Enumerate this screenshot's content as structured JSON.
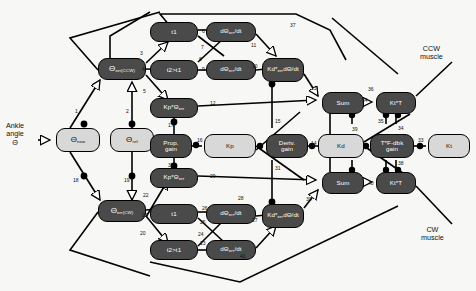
{
  "diagram": {
    "canvas": {
      "width": 476,
      "height": 291
    },
    "colors": {
      "dark_node": "#4a4a4a",
      "light_node": "#d8d8d8",
      "edge": "#000000",
      "background": "#f7f7f5",
      "text_light": "#ffffff",
      "text_dark": "#111111"
    },
    "free_labels": [
      {
        "name": "ankle-angle-label",
        "text": "Ankle\nangle\nΘ",
        "x": 6,
        "y": 122
      },
      {
        "name": "ccw-muscle-label",
        "text": "CCW\nmuscle",
        "x": 420,
        "y": 45
      },
      {
        "name": "cw-muscle-label",
        "text": "CW\nmuscle",
        "x": 421,
        "y": 226
      }
    ],
    "nodes": [
      {
        "id": "theta_now",
        "name": "node-theta-now",
        "label": "Θ",
        "sub": "now",
        "style": "light",
        "x": 56,
        "y": 128,
        "w": 44,
        "h": 24
      },
      {
        "id": "theta_ref",
        "name": "node-theta-ref",
        "label": "Θ",
        "sub": "ref",
        "style": "light",
        "x": 110,
        "y": 128,
        "w": 44,
        "h": 24
      },
      {
        "id": "theta_err_ccw",
        "name": "node-theta-err-ccw",
        "label": "Θ",
        "sub": "err(CCW)",
        "style": "dark",
        "x": 98,
        "y": 58,
        "w": 48,
        "h": 22
      },
      {
        "id": "theta_err_cw",
        "name": "node-theta-err-cw",
        "label": "Θ",
        "sub": "err(CW)",
        "style": "dark",
        "x": 98,
        "y": 200,
        "w": 48,
        "h": 22
      },
      {
        "id": "t1_top",
        "name": "node-t1-top",
        "label": "t1",
        "sub": "",
        "style": "dark",
        "x": 150,
        "y": 22,
        "w": 48,
        "h": 20
      },
      {
        "id": "t2t1_top",
        "name": "node-t2-gt-t1-top",
        "label": "t2>t1",
        "sub": "",
        "style": "dark",
        "x": 150,
        "y": 60,
        "w": 48,
        "h": 20
      },
      {
        "id": "dtheta1_top",
        "name": "node-dtheta-err-dt-top-1",
        "label": "dΘ",
        "sub": "err",
        "label2": "/dt",
        "style": "dark",
        "x": 206,
        "y": 22,
        "w": 50,
        "h": 20
      },
      {
        "id": "dtheta2_top",
        "name": "node-dtheta-err-dt-top-2",
        "label": "dΘ",
        "sub": "err",
        "label2": "/dt",
        "style": "dark",
        "x": 206,
        "y": 60,
        "w": 50,
        "h": 20
      },
      {
        "id": "kp_theta_top",
        "name": "node-kp-theta-err-top",
        "label": "Kp*Θ",
        "sub": "err",
        "style": "dark",
        "x": 150,
        "y": 98,
        "w": 48,
        "h": 20
      },
      {
        "id": "kd_dtheta_top",
        "name": "node-kd-dtheta-err-dt-top",
        "label": "Kd*",
        "label2": "dΘ",
        "sub": "err",
        "label3": "/dt",
        "style": "dark",
        "x": 262,
        "y": 58,
        "w": 42,
        "h": 24
      },
      {
        "id": "prop_gain",
        "name": "node-prop-gain",
        "label": "Prop.",
        "label2": "gain",
        "style": "dark",
        "x": 150,
        "y": 134,
        "w": 42,
        "h": 24
      },
      {
        "id": "kp",
        "name": "node-kp",
        "label": "Kp",
        "style": "light",
        "x": 204,
        "y": 134,
        "w": 52,
        "h": 24
      },
      {
        "id": "deriv_gain",
        "name": "node-deriv-gain",
        "label": "Deriv.",
        "label2": "gain",
        "style": "dark",
        "x": 266,
        "y": 134,
        "w": 42,
        "h": 24
      },
      {
        "id": "kd",
        "name": "node-kd",
        "label": "Kd",
        "style": "light",
        "x": 318,
        "y": 134,
        "w": 46,
        "h": 24
      },
      {
        "id": "tf_dbk_gain",
        "name": "node-t-f-dbk-gain",
        "label": "T*F-dbk",
        "label2": "gain",
        "style": "dark",
        "x": 370,
        "y": 134,
        "w": 44,
        "h": 24
      },
      {
        "id": "kt",
        "name": "node-kt",
        "label": "Kt",
        "style": "light",
        "x": 428,
        "y": 134,
        "w": 42,
        "h": 24
      },
      {
        "id": "kp_theta_bot",
        "name": "node-kp-theta-err-bottom",
        "label": "Kp*Θ",
        "sub": "err",
        "style": "dark",
        "x": 150,
        "y": 168,
        "w": 48,
        "h": 20
      },
      {
        "id": "t1_bot",
        "name": "node-t1-bottom",
        "label": "t1",
        "sub": "",
        "style": "dark",
        "x": 150,
        "y": 204,
        "w": 48,
        "h": 20
      },
      {
        "id": "t2t1_bot",
        "name": "node-t2-gt-t1-bottom",
        "label": "t2>t1",
        "sub": "",
        "style": "dark",
        "x": 150,
        "y": 240,
        "w": 48,
        "h": 20
      },
      {
        "id": "dtheta1_bot",
        "name": "node-dtheta-err-dt-bottom-1",
        "label": "dΘ",
        "sub": "err",
        "label2": "/dt",
        "style": "dark",
        "x": 206,
        "y": 204,
        "w": 50,
        "h": 20
      },
      {
        "id": "dtheta2_bot",
        "name": "node-dtheta-err-dt-bottom-2",
        "label": "dΘ",
        "sub": "err",
        "label2": "/dt",
        "style": "dark",
        "x": 206,
        "y": 240,
        "w": 50,
        "h": 20
      },
      {
        "id": "kd_dtheta_bot",
        "name": "node-kd-dtheta-err-dt-bottom",
        "label": "Kd*",
        "label2": "dΘ",
        "sub": "err",
        "label3": "/dt",
        "style": "dark",
        "x": 262,
        "y": 204,
        "w": 42,
        "h": 24
      },
      {
        "id": "sum_top",
        "name": "node-sum-top",
        "label": "Sum",
        "style": "dark",
        "x": 322,
        "y": 92,
        "w": 42,
        "h": 22
      },
      {
        "id": "kt_t_top",
        "name": "node-kt-t-top",
        "label": "Kt*T",
        "style": "dark",
        "x": 376,
        "y": 92,
        "w": 40,
        "h": 22
      },
      {
        "id": "sum_bot",
        "name": "node-sum-bottom",
        "label": "Sum",
        "style": "dark",
        "x": 322,
        "y": 172,
        "w": 42,
        "h": 22
      },
      {
        "id": "kt_t_bot",
        "name": "node-kt-t-bottom",
        "label": "Kt*T",
        "style": "dark",
        "x": 376,
        "y": 172,
        "w": 40,
        "h": 22
      }
    ],
    "edge_numbers": [
      {
        "n": "1",
        "x": 75,
        "y": 108
      },
      {
        "n": "2",
        "x": 126,
        "y": 108
      },
      {
        "n": "3",
        "x": 140,
        "y": 50
      },
      {
        "n": "4",
        "x": 142,
        "y": 66
      },
      {
        "n": "5",
        "x": 143,
        "y": 88
      },
      {
        "n": "6",
        "x": 202,
        "y": 28
      },
      {
        "n": "7",
        "x": 201,
        "y": 44
      },
      {
        "n": "8",
        "x": 199,
        "y": 56
      },
      {
        "n": "9",
        "x": 202,
        "y": 66
      },
      {
        "n": "10",
        "x": 252,
        "y": 63
      },
      {
        "n": "11",
        "x": 251,
        "y": 42
      },
      {
        "n": "12",
        "x": 210,
        "y": 100
      },
      {
        "n": "13",
        "x": 311,
        "y": 85
      },
      {
        "n": "14",
        "x": 311,
        "y": 140
      },
      {
        "n": "15",
        "x": 275,
        "y": 118
      },
      {
        "n": "16",
        "x": 197,
        "y": 137
      },
      {
        "n": "17",
        "x": 168,
        "y": 122
      },
      {
        "n": "18",
        "x": 73,
        "y": 177
      },
      {
        "n": "19",
        "x": 124,
        "y": 177
      },
      {
        "n": "20",
        "x": 140,
        "y": 230
      },
      {
        "n": "21",
        "x": 142,
        "y": 212
      },
      {
        "n": "22",
        "x": 143,
        "y": 192
      },
      {
        "n": "23",
        "x": 200,
        "y": 240
      },
      {
        "n": "24",
        "x": 198,
        "y": 231
      },
      {
        "n": "25",
        "x": 200,
        "y": 219
      },
      {
        "n": "26",
        "x": 202,
        "y": 205
      },
      {
        "n": "27",
        "x": 252,
        "y": 217
      },
      {
        "n": "28",
        "x": 238,
        "y": 195
      },
      {
        "n": "29",
        "x": 210,
        "y": 173
      },
      {
        "n": "30",
        "x": 306,
        "y": 196
      },
      {
        "n": "31",
        "x": 275,
        "y": 165
      },
      {
        "n": "32",
        "x": 168,
        "y": 162
      },
      {
        "n": "33",
        "x": 418,
        "y": 137
      },
      {
        "n": "34",
        "x": 398,
        "y": 125
      },
      {
        "n": "35",
        "x": 378,
        "y": 118
      },
      {
        "n": "36",
        "x": 368,
        "y": 86
      },
      {
        "n": "37",
        "x": 290,
        "y": 22
      },
      {
        "n": "38",
        "x": 398,
        "y": 160
      },
      {
        "n": "39",
        "x": 352,
        "y": 126
      },
      {
        "n": "40",
        "x": 368,
        "y": 180
      },
      {
        "n": "41",
        "x": 240,
        "y": 253
      },
      {
        "n": "34b",
        "x": 362,
        "y": 97
      }
    ]
  }
}
